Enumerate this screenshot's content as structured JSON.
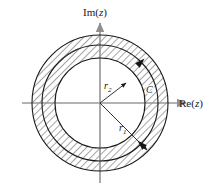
{
  "figure": {
    "background_color": "#ffffff",
    "width": 213,
    "height": 193
  },
  "axes": {
    "imaginary": {
      "label": "Im(z)",
      "label_prefix": "Im(",
      "label_var": "z",
      "label_suffix": ")",
      "icon": "arrow-up-icon",
      "color": "#9a9a9a"
    },
    "real": {
      "label": "Re(z)",
      "label_prefix": "Re(",
      "label_var": "z",
      "label_suffix": ")",
      "icon": "arrow-right-icon",
      "color": "#9a9a9a"
    },
    "origin": {
      "x": 100,
      "y": 103
    }
  },
  "circles": {
    "outer": {
      "name": "outer-boundary-circle",
      "radius": 68,
      "radius_label": "r",
      "radius_subscript": "1",
      "stroke": "#1a1a1a"
    },
    "contour": {
      "name": "integration-contour-circle",
      "radius": 58,
      "label": "C",
      "stroke": "#1a1a1a",
      "direction": "counterclockwise",
      "arrow_count": 2
    },
    "inner": {
      "name": "inner-boundary-circle",
      "radius": 45,
      "radius_label": "r",
      "radius_subscript": "2",
      "stroke": "#1a1a1a"
    }
  },
  "radii": {
    "r2": {
      "label": "r",
      "subscript": "2",
      "description": "inner radius pointer",
      "icon": "arrow-up-right-icon"
    },
    "r1": {
      "label": "r",
      "subscript": "1",
      "description": "outer radius pointer",
      "icon": "arrow-down-right-icon"
    }
  },
  "hatching": {
    "name": "annulus-hatch-fill",
    "pattern": "diagonal-lines",
    "angle_degrees": 45,
    "spacing": 5,
    "stroke": "#2b2b2b",
    "stroke_width": 0.8
  }
}
